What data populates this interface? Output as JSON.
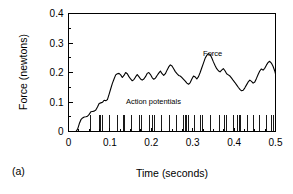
{
  "figure": {
    "panel_label": "(a)",
    "background_color": "#ffffff",
    "line_color": "#000000"
  },
  "chart_data": {
    "type": "line",
    "title": "",
    "xlabel": "Time (seconds)",
    "ylabel": "Force (newtons)",
    "xlim": [
      0,
      0.5
    ],
    "ylim": [
      0,
      0.4
    ],
    "xticks": [
      0,
      0.1,
      0.2,
      0.3,
      0.4,
      0.5
    ],
    "xtick_labels": [
      "0",
      "0.1",
      "0.2",
      "0.3",
      "0.4",
      "0.5"
    ],
    "yticks": [
      0,
      0.1,
      0.2,
      0.3,
      0.4
    ],
    "ytick_labels": [
      "0",
      "0.1",
      "0.2",
      "0.3",
      "0.4"
    ],
    "x_minor_tick_step": 0.025,
    "y_minor_tick_step": 0.05,
    "grid": false,
    "legend": "none",
    "annotations": [
      {
        "text": "Force",
        "x": 0.325,
        "y": 0.255
      },
      {
        "text": "Action potentials",
        "x": 0.205,
        "y": 0.092
      }
    ],
    "series": [
      {
        "name": "Force",
        "x": [
          0.0,
          0.018,
          0.022,
          0.026,
          0.03,
          0.034,
          0.038,
          0.042,
          0.046,
          0.05,
          0.054,
          0.058,
          0.062,
          0.066,
          0.07,
          0.074,
          0.078,
          0.082,
          0.086,
          0.09,
          0.094,
          0.098,
          0.102,
          0.106,
          0.11,
          0.114,
          0.118,
          0.122,
          0.126,
          0.13,
          0.134,
          0.138,
          0.142,
          0.146,
          0.15,
          0.154,
          0.158,
          0.162,
          0.166,
          0.17,
          0.174,
          0.178,
          0.182,
          0.186,
          0.19,
          0.194,
          0.198,
          0.202,
          0.206,
          0.21,
          0.214,
          0.218,
          0.222,
          0.226,
          0.23,
          0.234,
          0.238,
          0.242,
          0.246,
          0.25,
          0.254,
          0.258,
          0.262,
          0.266,
          0.27,
          0.274,
          0.278,
          0.282,
          0.286,
          0.29,
          0.294,
          0.298,
          0.302,
          0.306,
          0.31,
          0.314,
          0.318,
          0.322,
          0.326,
          0.33,
          0.334,
          0.338,
          0.342,
          0.346,
          0.35,
          0.354,
          0.358,
          0.362,
          0.366,
          0.37,
          0.374,
          0.378,
          0.382,
          0.386,
          0.39,
          0.394,
          0.398,
          0.402,
          0.406,
          0.41,
          0.414,
          0.418,
          0.422,
          0.426,
          0.43,
          0.434,
          0.438,
          0.442,
          0.446,
          0.45,
          0.454,
          0.458,
          0.462,
          0.466,
          0.47,
          0.474,
          0.478,
          0.482,
          0.486,
          0.49,
          0.494,
          0.498,
          0.5
        ],
        "y": [
          0.0,
          0.0,
          0.008,
          0.026,
          0.04,
          0.046,
          0.049,
          0.05,
          0.052,
          0.058,
          0.067,
          0.068,
          0.069,
          0.073,
          0.083,
          0.095,
          0.097,
          0.099,
          0.106,
          0.104,
          0.108,
          0.126,
          0.145,
          0.163,
          0.178,
          0.192,
          0.196,
          0.197,
          0.192,
          0.183,
          0.19,
          0.2,
          0.196,
          0.186,
          0.178,
          0.172,
          0.176,
          0.185,
          0.193,
          0.186,
          0.178,
          0.174,
          0.178,
          0.186,
          0.197,
          0.2,
          0.193,
          0.183,
          0.177,
          0.181,
          0.19,
          0.198,
          0.205,
          0.196,
          0.19,
          0.196,
          0.208,
          0.219,
          0.226,
          0.222,
          0.213,
          0.203,
          0.196,
          0.19,
          0.188,
          0.183,
          0.177,
          0.171,
          0.164,
          0.16,
          0.166,
          0.178,
          0.188,
          0.185,
          0.178,
          0.186,
          0.2,
          0.216,
          0.232,
          0.248,
          0.258,
          0.264,
          0.261,
          0.25,
          0.236,
          0.224,
          0.213,
          0.206,
          0.202,
          0.208,
          0.213,
          0.206,
          0.196,
          0.192,
          0.188,
          0.181,
          0.173,
          0.166,
          0.158,
          0.15,
          0.143,
          0.138,
          0.14,
          0.148,
          0.158,
          0.168,
          0.174,
          0.17,
          0.164,
          0.168,
          0.18,
          0.193,
          0.205,
          0.212,
          0.208,
          0.214,
          0.225,
          0.234,
          0.238,
          0.232,
          0.221,
          0.206,
          0.195
        ]
      }
    ],
    "spike_train": {
      "name": "Action potentials",
      "baseline": 0.0,
      "height": 0.055,
      "times": [
        0.052,
        0.074,
        0.078,
        0.082,
        0.098,
        0.118,
        0.132,
        0.136,
        0.152,
        0.172,
        0.176,
        0.196,
        0.204,
        0.208,
        0.224,
        0.244,
        0.262,
        0.278,
        0.282,
        0.286,
        0.29,
        0.304,
        0.318,
        0.324,
        0.342,
        0.364,
        0.378,
        0.382,
        0.398,
        0.408,
        0.412,
        0.416,
        0.432,
        0.446,
        0.462,
        0.478,
        0.49,
        0.496
      ]
    }
  }
}
